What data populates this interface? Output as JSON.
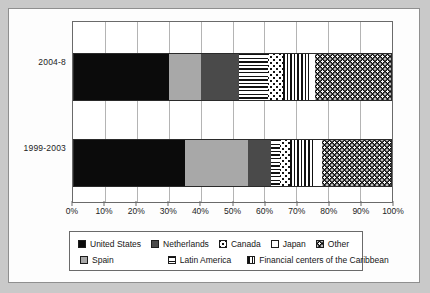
{
  "chart_data": {
    "type": "bar",
    "orientation": "horizontal",
    "stacked": true,
    "normalized_percent": true,
    "title": "",
    "subtitle": "",
    "xlabel": "",
    "ylabel": "",
    "xlim": [
      0,
      100
    ],
    "xtick_labels": [
      "0%",
      "10%",
      "20%",
      "30%",
      "40%",
      "50%",
      "60%",
      "70%",
      "80%",
      "90%",
      "100%"
    ],
    "xtick_values": [
      0,
      10,
      20,
      30,
      40,
      50,
      60,
      70,
      80,
      90,
      100
    ],
    "grid": "vertical",
    "legend_position": "bottom",
    "categories": [
      "2004-8",
      "1999-2003"
    ],
    "series": [
      {
        "name": "United States",
        "pattern": "solid-black",
        "color": "#0b0b0b",
        "values": [
          30,
          35
        ]
      },
      {
        "name": "Spain",
        "pattern": "solid-gray",
        "color": "#a8a8a8",
        "values": [
          10,
          20
        ]
      },
      {
        "name": "Netherlands",
        "pattern": "solid-darkgray",
        "color": "#4a4a4a",
        "values": [
          12,
          7
        ]
      },
      {
        "name": "Latin America",
        "pattern": "horizontal-lines",
        "color": "#111111",
        "values": [
          9,
          3
        ]
      },
      {
        "name": "Canada",
        "pattern": "light-dots",
        "color": "#151515",
        "values": [
          5,
          3
        ]
      },
      {
        "name": "Financial centers of the Caribbean",
        "pattern": "vertical-lines",
        "color": "#111111",
        "values": [
          8,
          8
        ]
      },
      {
        "name": "Japan",
        "pattern": "white",
        "color": "#ffffff",
        "values": [
          2,
          2
        ]
      },
      {
        "name": "Other",
        "pattern": "dark-dots",
        "color": "#0e0e0e",
        "values": [
          24,
          22
        ]
      }
    ]
  },
  "axis": {
    "ticks": [
      {
        "label": "0%",
        "value": 0
      },
      {
        "label": "10%",
        "value": 10
      },
      {
        "label": "20%",
        "value": 20
      },
      {
        "label": "30%",
        "value": 30
      },
      {
        "label": "40%",
        "value": 40
      },
      {
        "label": "50%",
        "value": 50
      },
      {
        "label": "60%",
        "value": 60
      },
      {
        "label": "70%",
        "value": 70
      },
      {
        "label": "80%",
        "value": 80
      },
      {
        "label": "90%",
        "value": 90
      },
      {
        "label": "100%",
        "value": 100
      }
    ]
  },
  "categories": [
    {
      "label": "2004-8"
    },
    {
      "label": "1999-2003"
    }
  ],
  "bars": {
    "top": {
      "category": "2004-8",
      "segments": [
        {
          "series": "United States",
          "value": 30
        },
        {
          "series": "Spain",
          "value": 10
        },
        {
          "series": "Netherlands",
          "value": 12
        },
        {
          "series": "Latin America",
          "value": 9
        },
        {
          "series": "Canada",
          "value": 5
        },
        {
          "series": "Financial centers of the Caribbean",
          "value": 8
        },
        {
          "series": "Japan",
          "value": 2
        },
        {
          "series": "Other",
          "value": 24
        }
      ]
    },
    "bottom": {
      "category": "1999-2003",
      "segments": [
        {
          "series": "United States",
          "value": 35
        },
        {
          "series": "Spain",
          "value": 20
        },
        {
          "series": "Netherlands",
          "value": 7
        },
        {
          "series": "Latin America",
          "value": 3
        },
        {
          "series": "Canada",
          "value": 3
        },
        {
          "series": "Financial centers of the Caribbean",
          "value": 8
        },
        {
          "series": "Japan",
          "value": 2
        },
        {
          "series": "Other",
          "value": 22
        }
      ]
    }
  },
  "legend": {
    "row1": [
      {
        "label": "United States",
        "pattern": "solid-black"
      },
      {
        "label": "Netherlands",
        "pattern": "solid-darkgray"
      },
      {
        "label": "Canada",
        "pattern": "light-dots"
      },
      {
        "label": "Japan",
        "pattern": "white"
      },
      {
        "label": "Other",
        "pattern": "dark-dots"
      }
    ],
    "row2": [
      {
        "label": "Spain",
        "pattern": "solid-gray"
      },
      {
        "label": "Latin America",
        "pattern": "horizontal-lines"
      },
      {
        "label": "Financial centers of the Caribbean",
        "pattern": "vertical-lines"
      }
    ]
  }
}
